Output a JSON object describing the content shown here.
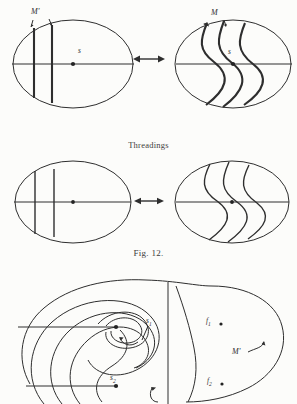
{
  "page": {
    "running_head": "",
    "figure_caption": "Fig. 12.",
    "section_label": "Threadings"
  },
  "figure_top": {
    "name": "threading-equivalence-top",
    "left_panel": {
      "name": "left-disc-straight-threads",
      "labels": [
        {
          "id": "m-prime",
          "text": "M'",
          "x": 34,
          "y": 11
        },
        {
          "id": "s-center",
          "text": "s",
          "x": 80,
          "y": 48
        }
      ],
      "center_dot": {
        "x": 73,
        "y": 58
      }
    },
    "right_panel": {
      "name": "right-disc-curved-threads",
      "labels": [
        {
          "id": "m",
          "text": "M",
          "x": 209,
          "y": 13
        },
        {
          "id": "s-center",
          "text": "s",
          "x": 228,
          "y": 49
        }
      ],
      "center_dot": {
        "x": 233,
        "y": 59
      }
    },
    "relation_symbol": {
      "id": "double-arrow",
      "text": "↔",
      "x": 137,
      "y": 53
    }
  },
  "figure_middle": {
    "name": "threading-equivalence-middle",
    "left_panel": {
      "name": "left-disc-straight-threads-2"
    },
    "right_panel": {
      "name": "right-disc-curved-threads-2"
    },
    "relation_symbol": {
      "id": "double-arrow",
      "text": "↔",
      "x": 137,
      "y": 52
    }
  },
  "figure_bottom": {
    "name": "spiral-region-diagram",
    "labels": [
      {
        "id": "s1",
        "text": "s",
        "sub": "1",
        "x": 146,
        "y": 322
      },
      {
        "id": "s2",
        "text": "s",
        "sub": "2",
        "x": 110,
        "y": 377
      },
      {
        "id": "f1",
        "text": "f",
        "sub": "1",
        "x": 206,
        "y": 321
      },
      {
        "id": "f2",
        "text": "f",
        "sub": "2",
        "x": 207,
        "y": 381
      },
      {
        "id": "m-prime",
        "text": "M'",
        "x": 233,
        "y": 352
      }
    ],
    "point_markers": [
      {
        "id": "f1-dot",
        "x": 221,
        "y": 324
      },
      {
        "id": "f2-dot",
        "x": 222,
        "y": 384
      },
      {
        "id": "s1-dot",
        "x": 116,
        "y": 325
      },
      {
        "id": "s2-dot",
        "x": 115,
        "y": 385
      }
    ]
  },
  "colors": {
    "ink": "#2e2e2e",
    "paper": "#fcfcfa",
    "faint": "#9a9a9a"
  }
}
